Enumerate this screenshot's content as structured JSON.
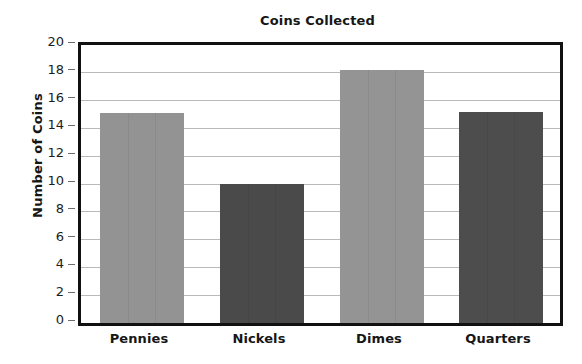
{
  "chart_data": {
    "type": "bar",
    "title": "Coins Collected",
    "xlabel": "",
    "ylabel": "Number of Coins",
    "categories": [
      "Pennies",
      "Nickels",
      "Dimes",
      "Quarters"
    ],
    "values": [
      15.1,
      10.0,
      18.2,
      15.2
    ],
    "ylim": [
      0,
      20
    ],
    "y_ticks": [
      0,
      2,
      4,
      6,
      8,
      10,
      12,
      14,
      16,
      18,
      20
    ],
    "y_tick_labels": [
      "0",
      "2",
      "4",
      "6",
      "8",
      "10",
      "12",
      "14",
      "16",
      "18",
      "20"
    ],
    "grid": true,
    "legend": "none",
    "bar_colors": [
      "#939393",
      "#4a4a4a",
      "#949494",
      "#4d4d4d"
    ],
    "series": [
      {
        "name": "Number of Coins",
        "values": [
          15.1,
          10.0,
          18.2,
          15.2
        ]
      }
    ],
    "points": [
      {
        "category": "Pennies",
        "value": 15.1,
        "color": "#939393"
      },
      {
        "category": "Nickels",
        "value": 10.0,
        "color": "#4a4a4a"
      },
      {
        "category": "Dimes",
        "value": 18.2,
        "color": "#949494"
      },
      {
        "category": "Quarters",
        "value": 15.2,
        "color": "#4d4d4d"
      }
    ]
  },
  "colors": {
    "bar_light": "#939393",
    "bar_dark": "#4a4a4a",
    "gridline": "#b9b9b9",
    "axis_frame": "#111111",
    "text": "#161616",
    "background": "#ffffff"
  }
}
